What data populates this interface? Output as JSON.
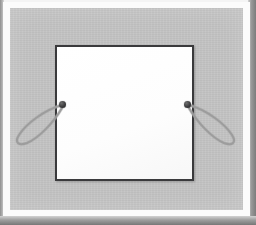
{
  "scene": {
    "title": "Framed gray mat board with white square aperture",
    "subject": "picture frame mat with hanging hardware",
    "capture_note": "flatbed-style scan, white paper border, soft drop shadow at right and bottom edges"
  },
  "colors": {
    "mat_gray": "#c3c3c3",
    "aperture_white": "#ffffff",
    "aperture_border": "#3a3a3c",
    "paper_white": "#fbfbfb",
    "knob_dark": "#3c3c3e",
    "wire_gray": "#9b9b9b",
    "shadow_gray": "#7c7c7c"
  },
  "frame": {
    "outer_paper_label": "white paper border",
    "mat_label": "gray mat panel",
    "top_edge_label": "top light edge",
    "left_edge_label": "left scan edge",
    "right_edge_label": "right shadow edge",
    "bottom_edge_label": "bottom shadow edge"
  },
  "aperture": {
    "label": "white square opening",
    "shape": "square",
    "border_label": "dark outline"
  },
  "hardware": {
    "left_knob_label": "left mounting knob",
    "right_knob_label": "right mounting knob",
    "left_loop_label": "left wire loop",
    "right_loop_label": "right wire loop",
    "count": 2
  }
}
